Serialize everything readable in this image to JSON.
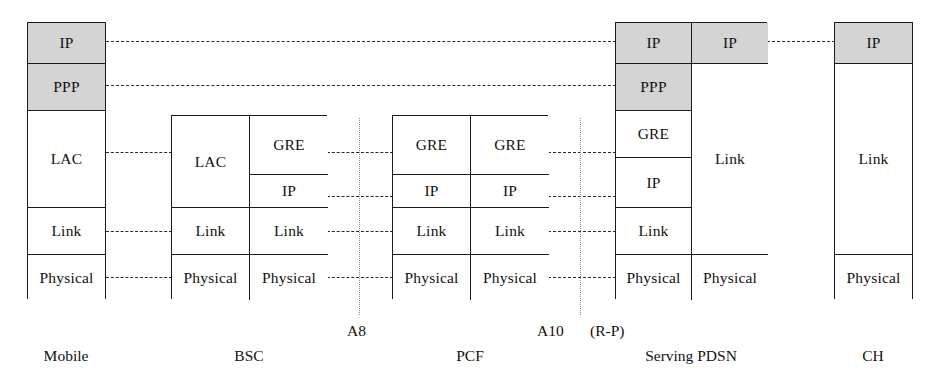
{
  "diagram": {
    "colors": {
      "shaded_fill": "#d4d4d4",
      "plain_fill": "#ffffff",
      "stroke": "#1a1a1a",
      "connector": "#2a2a2a",
      "interface_line": "#8a8a8a"
    }
  },
  "nodes": [
    {
      "id": "mobile",
      "label": "Mobile",
      "layers": [
        {
          "name": "IP",
          "shaded": true
        },
        {
          "name": "PPP",
          "shaded": true
        },
        {
          "name": "LAC",
          "shaded": false
        },
        {
          "name": "Link",
          "shaded": false
        },
        {
          "name": "Physical",
          "shaded": false
        }
      ]
    },
    {
      "id": "bsc",
      "label": "BSC",
      "left_column": [
        {
          "name": "LAC",
          "shaded": false
        },
        {
          "name": "Link",
          "shaded": false
        },
        {
          "name": "Physical",
          "shaded": false
        }
      ],
      "right_column": [
        {
          "name": "GRE",
          "shaded": false
        },
        {
          "name": "IP",
          "shaded": false
        },
        {
          "name": "Link",
          "shaded": false
        },
        {
          "name": "Physical",
          "shaded": false
        }
      ]
    },
    {
      "id": "pcf",
      "label": "PCF",
      "left_column": [
        {
          "name": "GRE",
          "shaded": false
        },
        {
          "name": "IP",
          "shaded": false
        },
        {
          "name": "Link",
          "shaded": false
        },
        {
          "name": "Physical",
          "shaded": false
        }
      ],
      "right_column": [
        {
          "name": "GRE",
          "shaded": false
        },
        {
          "name": "IP",
          "shaded": false
        },
        {
          "name": "Link",
          "shaded": false
        },
        {
          "name": "Physical",
          "shaded": false
        }
      ]
    },
    {
      "id": "serving-pdsn",
      "label": "Serving PDSN",
      "left_column": [
        {
          "name": "IP",
          "shaded": true
        },
        {
          "name": "PPP",
          "shaded": true
        },
        {
          "name": "GRE",
          "shaded": false
        },
        {
          "name": "IP",
          "shaded": false
        },
        {
          "name": "Link",
          "shaded": false
        },
        {
          "name": "Physical",
          "shaded": false
        }
      ],
      "right_column": [
        {
          "name": "IP",
          "shaded": true
        },
        {
          "name": "Link",
          "shaded": false
        },
        {
          "name": "Physical",
          "shaded": false
        }
      ]
    },
    {
      "id": "ch",
      "label": "CH",
      "layers": [
        {
          "name": "IP",
          "shaded": true
        },
        {
          "name": "Link",
          "shaded": false
        },
        {
          "name": "Physical",
          "shaded": false
        }
      ]
    }
  ],
  "interfaces": [
    {
      "id": "a8",
      "label": "A8"
    },
    {
      "id": "a10",
      "label": "A10"
    },
    {
      "id": "rp",
      "label": "(R-P)"
    }
  ],
  "peer_connections": [
    {
      "id": "ip-peer",
      "layer": "IP"
    },
    {
      "id": "ppp-peer",
      "layer": "PPP"
    },
    {
      "id": "lac-peer",
      "layer": "LAC"
    },
    {
      "id": "gre-bsc-pcf",
      "layer": "GRE"
    },
    {
      "id": "ip-bsc-pcf",
      "layer": "IP"
    },
    {
      "id": "link-bsc-pcf",
      "layer": "Link"
    },
    {
      "id": "phy-bsc-pcf",
      "layer": "Physical"
    },
    {
      "id": "gre-pcf-pdsn",
      "layer": "GRE"
    },
    {
      "id": "ip-pcf-pdsn",
      "layer": "IP"
    },
    {
      "id": "link-pcf-pdsn",
      "layer": "Link"
    },
    {
      "id": "phy-pcf-pdsn",
      "layer": "Physical"
    },
    {
      "id": "link-mob-bsc",
      "layer": "Link"
    },
    {
      "id": "phy-mob-bsc",
      "layer": "Physical"
    },
    {
      "id": "ip-pdsn-ch",
      "layer": "IP"
    }
  ]
}
